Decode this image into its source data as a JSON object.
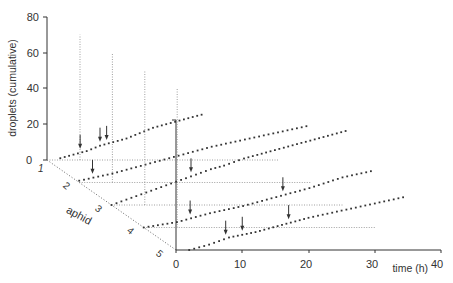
{
  "chart_data": {
    "type": "scatter",
    "subtype": "3d-waterfall",
    "title": "",
    "ylabel": "droplets (cumulative)",
    "xlabel": "time (h)",
    "zlabel": "aphid",
    "y_ticks": [
      0,
      20,
      40,
      60,
      80
    ],
    "x_ticks": [
      0,
      10,
      20,
      30,
      40
    ],
    "z_ticks": [
      1,
      2,
      3,
      4,
      5
    ],
    "ylim": [
      0,
      80
    ],
    "xlim": [
      0,
      40
    ],
    "grid": "dotted reference lines",
    "series": [
      {
        "name": "aphid 1",
        "x": [
          2,
          4,
          6,
          8,
          10,
          12,
          14,
          16,
          18,
          20,
          22,
          24
        ],
        "y": [
          1,
          3,
          5,
          8,
          10,
          12,
          15,
          18,
          20,
          22,
          24,
          26
        ],
        "arrows_at_h": [
          5,
          8,
          9
        ]
      },
      {
        "name": "aphid 2",
        "x": [
          0,
          5,
          10,
          15,
          20,
          25,
          30,
          35
        ],
        "y": [
          1,
          5,
          10,
          15,
          20,
          24,
          28,
          32
        ],
        "arrows_at_h": [
          2
        ]
      },
      {
        "name": "aphid 3",
        "x": [
          0,
          3,
          6,
          9,
          12,
          15,
          17,
          20,
          24,
          28,
          32,
          36
        ],
        "y": [
          0,
          4,
          8,
          12,
          16,
          20,
          22,
          26,
          30,
          34,
          38,
          42
        ],
        "arrows_at_h": [
          12
        ]
      },
      {
        "name": "aphid 4",
        "x": [
          0,
          5,
          10,
          15,
          20,
          25,
          30,
          35
        ],
        "y": [
          0,
          3,
          8,
          12,
          17,
          22,
          28,
          32
        ],
        "arrows_at_h": [
          7,
          21
        ]
      },
      {
        "name": "aphid 5",
        "x": [
          2,
          5,
          8,
          12,
          16,
          20,
          25,
          30,
          35
        ],
        "y": [
          0,
          3,
          7,
          10,
          14,
          18,
          22,
          26,
          30
        ],
        "arrows_at_h": [
          7.5,
          10,
          17
        ]
      }
    ],
    "back_axis_tops": [
      70,
      60,
      50,
      40,
      30
    ]
  },
  "labels": {
    "ylabel": "droplets (cumulative)",
    "xlabel": "time (h)",
    "zlabel": "aphid",
    "y0": "0",
    "y20": "20",
    "y40": "40",
    "y60": "60",
    "y80": "80",
    "x0": "0",
    "x10": "10",
    "x20": "20",
    "x30": "30",
    "x40": "40",
    "z1": "1",
    "z2": "2",
    "z3": "3",
    "z4": "4",
    "z5": "5"
  }
}
